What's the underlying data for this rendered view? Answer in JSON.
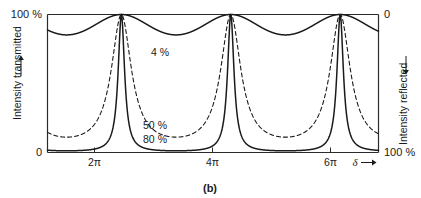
{
  "figure": {
    "caption": "(b)",
    "axes": {
      "left": {
        "title": "Intensity transmitted",
        "arrow": "up-arrow-icon",
        "top_label": "100 %",
        "bottom_label": "0"
      },
      "right": {
        "title": "Intensity reflected",
        "arrow": "down-arrow-icon",
        "top_label": "0",
        "bottom_label": "100 %"
      },
      "bottom": {
        "variable_label": "δ",
        "arrow": "right-arrow-icon",
        "tick_labels": [
          "2π",
          "4π",
          "6π"
        ]
      }
    },
    "curve_labels": [
      {
        "text": "4 %",
        "style": "solid"
      },
      {
        "text": "50 %",
        "style": "dashed"
      },
      {
        "text": "80 %",
        "style": "solid"
      }
    ]
  },
  "chart_data": {
    "type": "line",
    "title": "",
    "subtitle": "",
    "xlabel": "δ",
    "ylabel": "Intensity transmitted",
    "y2label": "Intensity reflected",
    "xlim": [
      2.04,
      21.05
    ],
    "ylim": [
      0,
      1
    ],
    "y2lim": [
      1,
      0
    ],
    "xtick_values": [
      6.283185,
      12.566371,
      18.849556
    ],
    "xtick_labels": [
      "2π",
      "4π",
      "6π"
    ],
    "ytick_values": [
      0,
      1
    ],
    "ytick_labels": [
      "0",
      "100 %"
    ],
    "y2tick_values": [
      0,
      1
    ],
    "y2tick_labels": [
      "0",
      "100 %"
    ],
    "grid": false,
    "legend": "inline-curve-labels",
    "function": "Airy transmittance  T(δ) = 1 / (1 + F sin^2(δ/2)),  F = 4R/(1-R)^2",
    "series": [
      {
        "name": "4 %",
        "reflectance": 0.04,
        "finesse_F": 0.1736,
        "style": "solid",
        "min_transmittance": 0.852,
        "max_transmittance": 1.0,
        "label_x": 9.4,
        "label_y": 0.76
      },
      {
        "name": "50 %",
        "reflectance": 0.5,
        "finesse_F": 8.0,
        "style": "dashed",
        "min_transmittance": 0.111,
        "max_transmittance": 1.0,
        "label_x": 9.0,
        "label_y": 0.2
      },
      {
        "name": "80 %",
        "reflectance": 0.8,
        "finesse_F": 80.0,
        "style": "solid",
        "min_transmittance": 0.0123,
        "max_transmittance": 1.0,
        "label_x": 9.0,
        "label_y": 0.1
      }
    ],
    "annotations": [
      {
        "text": "(b)",
        "role": "figure-caption",
        "position": "below-axes-center"
      }
    ]
  }
}
